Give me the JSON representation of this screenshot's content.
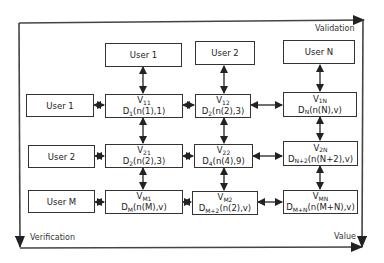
{
  "frame": {
    "top_label": "Validation",
    "bottom_label": "Verification",
    "right_label": "Value"
  },
  "column_users": [
    {
      "label": "User 1"
    },
    {
      "label": "User 2"
    },
    {
      "label": "User N"
    }
  ],
  "row_users": [
    {
      "label": "User 1"
    },
    {
      "label": "User 2"
    },
    {
      "label": "User M"
    }
  ],
  "cells": [
    [
      {
        "v": "V",
        "v_sub": "11",
        "d": "D",
        "d_sub": "1",
        "d_args": "(n(1),1)"
      },
      {
        "v": "V",
        "v_sub": "12",
        "d": "D",
        "d_sub": "2",
        "d_args": "(n(2),3)"
      },
      {
        "v": "V",
        "v_sub": "1N",
        "d": "D",
        "d_sub": "N",
        "d_args": "(n(N),v)"
      }
    ],
    [
      {
        "v": "V",
        "v_sub": "21",
        "d": "D",
        "d_sub": "2",
        "d_args": "(n(2),3)"
      },
      {
        "v": "V",
        "v_sub": "22",
        "d": "D",
        "d_sub": "4",
        "d_args": "(n(4),9)"
      },
      {
        "v": "V",
        "v_sub": "2N",
        "d": "D",
        "d_sub": "N+2",
        "d_args": "(n(N+2),v)"
      }
    ],
    [
      {
        "v": "V",
        "v_sub": "M1",
        "d": "D",
        "d_sub": "M",
        "d_args": "(n(M),v)"
      },
      {
        "v": "V",
        "v_sub": "M2",
        "d": "D",
        "d_sub": "M+2",
        "d_args": "(n(2),v)"
      },
      {
        "v": "V",
        "v_sub": "MN",
        "d": "D",
        "d_sub": "M+N",
        "d_args": "(n(M+N),v)"
      }
    ]
  ]
}
